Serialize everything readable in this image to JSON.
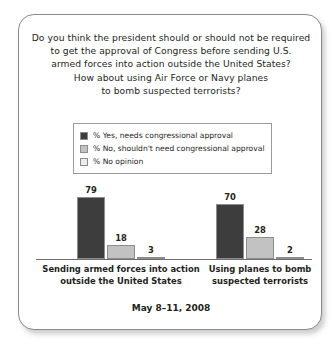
{
  "card": {
    "title_lines": [
      "Do you think the president should or should not be required",
      "to get the approval of Congress before sending U.S.",
      "armed forces into action outside the United States?",
      "How about using Air Force or Navy planes",
      "to bomb suspected terrorists?"
    ],
    "footer_date": "May 8–11, 2008"
  },
  "colors": {
    "series_yes": "#3d3d3d",
    "series_no": "#c2c2c2",
    "series_no_opinion": "#ededed",
    "swatch_border": "#8d8d8d",
    "axis": "#6f6f6f",
    "card_border": "#8a8a8a",
    "text": "#231f20",
    "background": "#ffffff"
  },
  "chart_data": {
    "type": "bar",
    "xlabel": "",
    "ylabel": "",
    "ylim": [
      0,
      100
    ],
    "grid": false,
    "legend_position": "top-center",
    "annotation": "May 8–11, 2008",
    "categories": [
      "Sending armed forces into action outside the United States",
      "Using planes to bomb suspected terrorists"
    ],
    "category_lines": [
      [
        "Sending armed forces into action",
        "outside the United States"
      ],
      [
        "Using planes to bomb",
        "suspected terrorists"
      ]
    ],
    "series": [
      {
        "name": "% Yes, needs congressional approval",
        "color": "#3d3d3d",
        "values": [
          79,
          70
        ]
      },
      {
        "name": "% No, shouldn't need congressional approval",
        "color": "#c2c2c2",
        "values": [
          18,
          28
        ]
      },
      {
        "name": "% No opinion",
        "color": "#ededed",
        "values": [
          3,
          2
        ]
      }
    ]
  },
  "legend": {
    "items": [
      {
        "label": "% Yes, needs congressional approval",
        "color": "#3d3d3d"
      },
      {
        "label": "% No, shouldn't need congressional approval",
        "color": "#c2c2c2"
      },
      {
        "label": "% No opinion",
        "color": "#ededed"
      }
    ]
  }
}
